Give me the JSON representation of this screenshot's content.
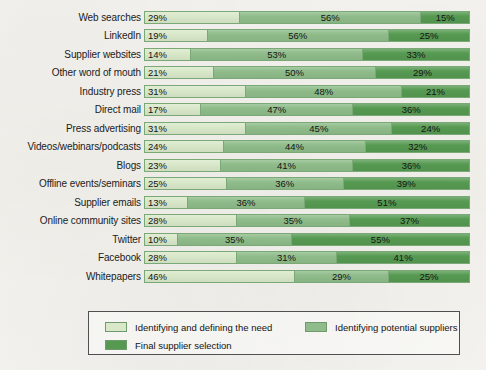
{
  "chart_data": {
    "type": "bar",
    "orientation": "horizontal",
    "stacked": true,
    "normalized": true,
    "title": "",
    "subtitle": "",
    "xlabel": "",
    "ylabel": "",
    "xlim": [
      0,
      100
    ],
    "grid": false,
    "legend_position": "bottom",
    "value_suffix": "%",
    "categories": [
      "Web searches",
      "LinkedIn",
      "Supplier websites",
      "Other word of mouth",
      "Industry press",
      "Direct mail",
      "Press advertising",
      "Videos/webinars/podcasts",
      "Blogs",
      "Offline events/seminars",
      "Supplier emails",
      "Online community sites",
      "Twitter",
      "Facebook",
      "Whitepapers"
    ],
    "series": [
      {
        "name": "Identifying and defining the need",
        "color": "#d9e8c9",
        "values": [
          29,
          19,
          14,
          21,
          31,
          17,
          31,
          24,
          23,
          25,
          13,
          28,
          10,
          28,
          46
        ],
        "labels": [
          "29%",
          "19%",
          "14%",
          "21%",
          "31%",
          "17%",
          "31%",
          "24%",
          "23%",
          "25%",
          "13%",
          "28%",
          "10%",
          "28%",
          "46%"
        ]
      },
      {
        "name": "Identifying potential suppliers",
        "color": "#8fbc8a",
        "values": [
          56,
          56,
          53,
          50,
          48,
          47,
          45,
          44,
          41,
          36,
          36,
          35,
          35,
          31,
          29
        ],
        "labels": [
          "56%",
          "56%",
          "53%",
          "50%",
          "48%",
          "47%",
          "45%",
          "44%",
          "41%",
          "36%",
          "36%",
          "35%",
          "35%",
          "31%",
          "29%"
        ]
      },
      {
        "name": "Final supplier selection",
        "color": "#569a52",
        "values": [
          15,
          25,
          33,
          29,
          21,
          36,
          24,
          32,
          36,
          39,
          51,
          37,
          55,
          41,
          25
        ],
        "labels": [
          "15%",
          "25%",
          "33%",
          "29%",
          "21%",
          "36%",
          "24%",
          "32%",
          "36%",
          "39%",
          "51%",
          "37%",
          "55%",
          "41%",
          "25%"
        ]
      }
    ]
  },
  "legend": {
    "entries": [
      {
        "label": "Identifying and defining the need",
        "color": "#d9e8c9"
      },
      {
        "label": "Identifying potential suppliers",
        "color": "#8fbc8a"
      },
      {
        "label": "Final supplier selection",
        "color": "#569a52"
      }
    ]
  }
}
